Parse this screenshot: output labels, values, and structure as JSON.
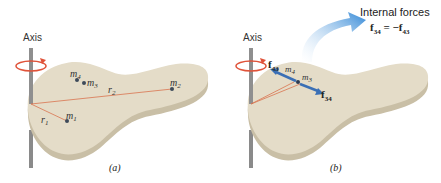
{
  "panel_a": {
    "axis_label": "Axis",
    "caption": "(a)",
    "masses": [
      {
        "id": "m1",
        "base": "m",
        "sub": "1"
      },
      {
        "id": "m2",
        "base": "m",
        "sub": "2"
      },
      {
        "id": "m3",
        "base": "m",
        "sub": "3"
      },
      {
        "id": "m4",
        "base": "m",
        "sub": "4"
      }
    ],
    "radii": [
      {
        "id": "r1",
        "base": "r",
        "sub": "1"
      },
      {
        "id": "r2",
        "base": "r",
        "sub": "2"
      }
    ]
  },
  "panel_b": {
    "axis_label": "Axis",
    "caption": "(b)",
    "title": "Internal forces",
    "equation": {
      "lhs_base": "f",
      "lhs_sub": "34",
      "rhs_sign": "= −",
      "rhs_base": "f",
      "rhs_sub": "43"
    },
    "force_f43": {
      "base": "f",
      "sub": "43"
    },
    "force_f34": {
      "base": "f",
      "sub": "34"
    },
    "masses": [
      {
        "id": "m3",
        "base": "m",
        "sub": "3"
      },
      {
        "id": "m4",
        "base": "m",
        "sub": "4"
      }
    ]
  },
  "colors": {
    "body_fill": "#e4dcc8",
    "body_edge": "#c9bfa6",
    "axis_rod": "#8a8a8a",
    "rotation_arrow": "#e0533a",
    "radius_line": "#d9744f",
    "force_arrow": "#3a6fb5",
    "callout_arrow": "#3d8fd8"
  }
}
